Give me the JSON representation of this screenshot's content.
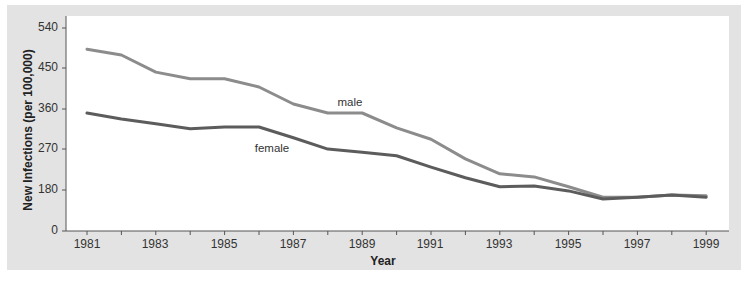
{
  "chart_data": {
    "type": "line",
    "title": "",
    "xlabel": "Year",
    "ylabel": "New Infections (per 100,000)",
    "x": [
      1981,
      1982,
      1983,
      1984,
      1985,
      1986,
      1987,
      1988,
      1989,
      1990,
      1991,
      1992,
      1993,
      1994,
      1995,
      1996,
      1997,
      1998,
      1999
    ],
    "series": [
      {
        "name": "male",
        "color": "#8c8c8c",
        "values": [
          493,
          480,
          442,
          427,
          427,
          409,
          371,
          351,
          351,
          318,
          293,
          249,
          216,
          209,
          187,
          164,
          164,
          169,
          167
        ]
      },
      {
        "name": "female",
        "color": "#5c5c5c",
        "values": [
          351,
          338,
          327,
          316,
          320,
          320,
          296,
          271,
          264,
          256,
          231,
          207,
          187,
          189,
          178,
          160,
          164,
          169,
          164
        ]
      }
    ],
    "yticks": [
      "0",
      "180",
      "270",
      "360",
      "450",
      "540"
    ],
    "xticks": [
      "1981",
      "1983",
      "1985",
      "1987",
      "1989",
      "1991",
      "1993",
      "1995",
      "1997",
      "1999"
    ],
    "ylim": [
      0,
      540
    ],
    "axis_break": "between 0 and 180",
    "grid": false,
    "legend": "inline labels"
  },
  "axes": {
    "xlabel": "Year",
    "ylabel": "New Infections (per 100,000)",
    "yticks": [
      {
        "label": "540",
        "y": 28
      },
      {
        "label": "450",
        "y": 68
      },
      {
        "label": "360",
        "y": 109
      },
      {
        "label": "270",
        "y": 149
      },
      {
        "label": "180",
        "y": 190
      },
      {
        "label": "0",
        "y": 231
      }
    ],
    "xticks": [
      {
        "label": "1981",
        "x": 87
      },
      {
        "label": "1983",
        "x": 155
      },
      {
        "label": "1985",
        "x": 224
      },
      {
        "label": "1987",
        "x": 293
      },
      {
        "label": "1989",
        "x": 362
      },
      {
        "label": "1991",
        "x": 430
      },
      {
        "label": "1993",
        "x": 499
      },
      {
        "label": "1995",
        "x": 568
      },
      {
        "label": "1997",
        "x": 637
      },
      {
        "label": "1999",
        "x": 706
      }
    ]
  },
  "labels": {
    "male": "male",
    "female": "female"
  }
}
